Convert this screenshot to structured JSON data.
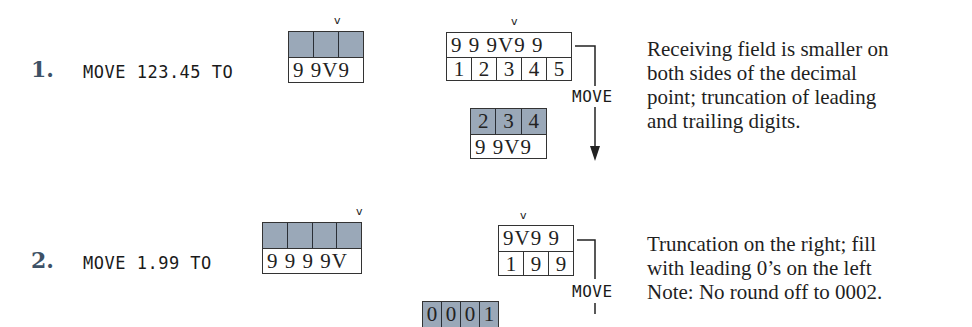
{
  "examples": [
    {
      "number": "1.",
      "statement": "MOVE 123.45 TO",
      "receiving_field": {
        "picture": "9 9V9",
        "cells": [
          "",
          "",
          ""
        ],
        "shaded": true
      },
      "sending_field": {
        "picture": "9 9 9V9 9",
        "cells": [
          "1",
          "2",
          "3",
          "4",
          "5"
        ]
      },
      "result_field": {
        "cells": [
          "2",
          "3",
          "4"
        ],
        "picture": "9 9V9"
      },
      "move_label": "MOVE",
      "description": "Receiving field is smaller on both sides of the decimal point; truncation of leading and trailing digits.",
      "description_lines": [
        "Receiving field is smaller on",
        "both sides of the decimal",
        "point; truncation of leading",
        "and trailing digits."
      ]
    },
    {
      "number": "2.",
      "statement": "MOVE 1.99 TO",
      "receiving_field": {
        "picture": "9 9 9 9V",
        "cells": [
          "",
          "",
          "",
          ""
        ],
        "shaded": true
      },
      "sending_field": {
        "picture": "9V9 9",
        "cells": [
          "1",
          "9",
          "9"
        ]
      },
      "result_field": {
        "cells": [
          "0",
          "0",
          "0",
          "1"
        ]
      },
      "move_label": "MOVE",
      "description_lines": [
        "Truncation on the right; fill",
        "with leading 0’s on the left",
        "Note: No round off to 0002."
      ]
    }
  ],
  "decimal_marker": "v",
  "colors": {
    "shaded_cell": "#9aa8b8",
    "number_label": "#3d5166"
  }
}
